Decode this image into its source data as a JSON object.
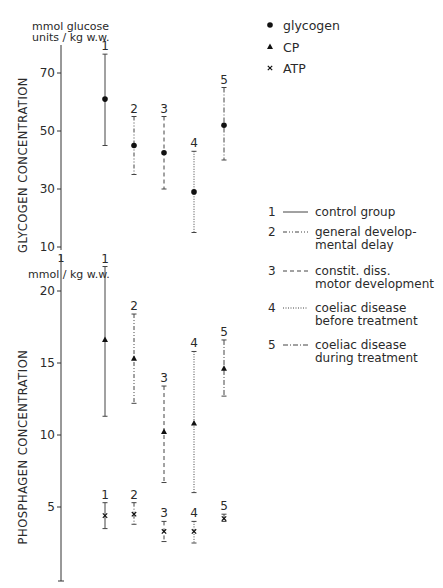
{
  "chart_data": [
    {
      "type": "scatter",
      "subtype": "error-bar",
      "title": "",
      "ylabel": "GLYCOGEN CONCENTRATION",
      "yunit": "mmol glucose units / kg w.w.",
      "ylim": [
        10,
        80
      ],
      "yticks": [
        10,
        30,
        50,
        70
      ],
      "xlabel": "",
      "categories": [
        "1",
        "2",
        "3",
        "4",
        "5"
      ],
      "series": [
        {
          "name": "glycogen",
          "marker": "circle",
          "values": [
            61,
            45,
            42.5,
            29,
            52
          ],
          "upper": [
            76.5,
            55,
            55,
            43,
            65
          ],
          "lower": [
            45,
            35,
            30,
            15,
            40
          ]
        }
      ],
      "grid": false
    },
    {
      "type": "scatter",
      "subtype": "error-bar",
      "title": "",
      "ylabel": "PHOSPHAGEN CONCENTRATION",
      "yunit": "mmol / kg w.w.",
      "ylim": [
        0,
        22
      ],
      "yticks": [
        5,
        10,
        15,
        20
      ],
      "xlabel": "",
      "categories": [
        "1",
        "2",
        "3",
        "4",
        "5"
      ],
      "series": [
        {
          "name": "CP",
          "marker": "triangle",
          "values": [
            16.6,
            15.3,
            10.2,
            10.8,
            14.6
          ],
          "upper": [
            21.7,
            18.4,
            13.4,
            15.8,
            16.6
          ],
          "lower": [
            11.3,
            12.2,
            6.7,
            6.0,
            12.7
          ]
        },
        {
          "name": "ATP",
          "marker": "x",
          "values": [
            4.4,
            4.5,
            3.3,
            3.3,
            4.2
          ],
          "upper": [
            5.3,
            5.3,
            4.0,
            4.0,
            4.5
          ],
          "lower": [
            3.5,
            3.8,
            2.6,
            2.5,
            4.0
          ]
        }
      ],
      "grid": false
    }
  ],
  "top_panel": {
    "unit_line1": "mmol glucose",
    "unit_line2": "units / kg w.w.",
    "axis_title": "GLYCOGEN CONCENTRATION",
    "ticks": [
      "70",
      "50",
      "30",
      "10"
    ]
  },
  "bottom_panel": {
    "unit": "mmol / kg w.w.",
    "axis_title": "PHOSPHAGEN CONCENTRATION",
    "ticks": [
      "20",
      "15",
      "10",
      "5"
    ]
  },
  "symbol_legend": [
    {
      "symbol": "circle",
      "label": "glycogen"
    },
    {
      "symbol": "triangle",
      "label": "CP"
    },
    {
      "symbol": "x",
      "label": "ATP"
    }
  ],
  "group_legend": [
    {
      "num": "1",
      "style": "solid",
      "lines": [
        "control group"
      ]
    },
    {
      "num": "2",
      "style": "dash-dot-dot",
      "lines": [
        "general develop-",
        "mental delay"
      ]
    },
    {
      "num": "3",
      "style": "dashed",
      "lines": [
        "constit. diss.",
        "motor development"
      ]
    },
    {
      "num": "4",
      "style": "dotted",
      "lines": [
        "coeliac disease",
        "before treatment"
      ]
    },
    {
      "num": "5",
      "style": "dash-dot",
      "lines": [
        "coeliac disease",
        "during treatment"
      ]
    }
  ],
  "group_numbers": [
    "1",
    "2",
    "3",
    "4",
    "5"
  ]
}
